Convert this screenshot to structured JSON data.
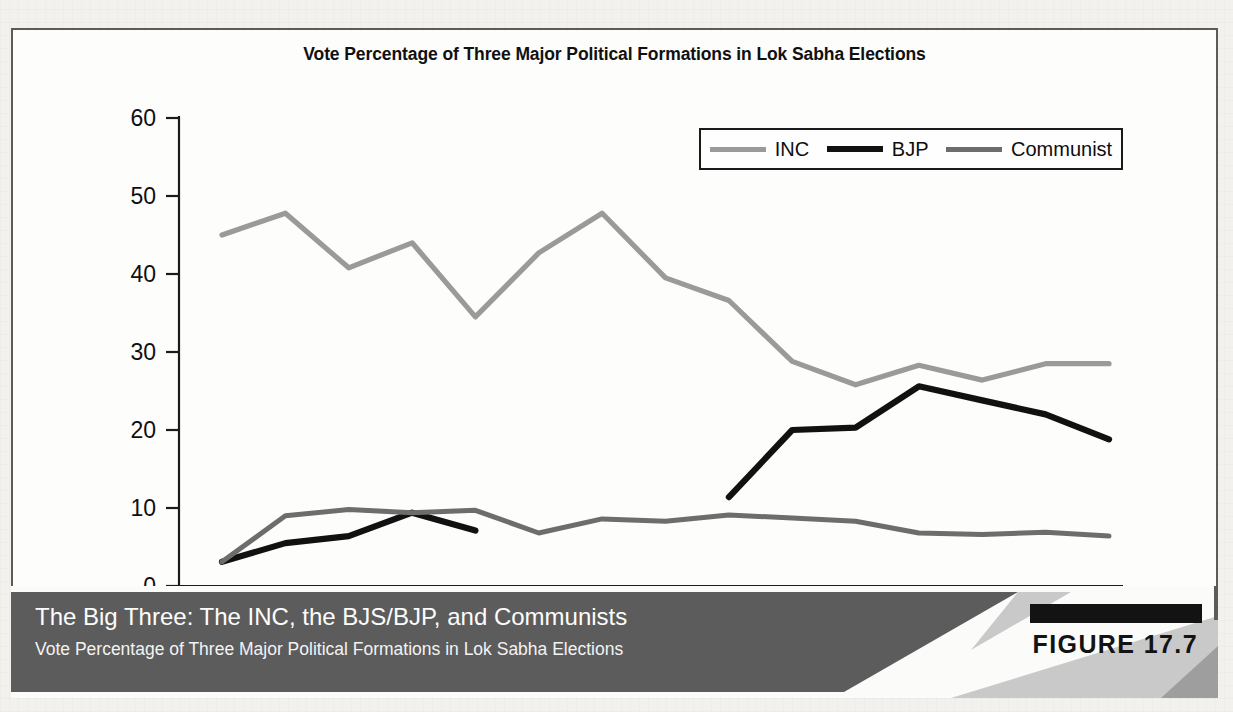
{
  "figure": {
    "badge_label": "FIGURE 17.7",
    "caption_title": "The Big Three: The INC, the BJS/BJP, and Communists",
    "caption_subtitle": "Vote Percentage of Three Major Political Formations in Lok Sabha Elections"
  },
  "colors": {
    "inc": "#9a9a9a",
    "bjp": "#111111",
    "communist": "#6d6d6d",
    "axis": "#1b1b1b",
    "panel_border": "#5b5b5b",
    "caption_bar": "#5c5c5c",
    "caption_bar_light": "#c9c9c9",
    "page": "#f2f1ee"
  },
  "chart_data": {
    "type": "line",
    "title": "Vote Percentage of Three Major Political Formations in Lok Sabha Elections",
    "xlabel": "",
    "ylabel": "",
    "ylim": [
      0,
      60
    ],
    "yticks": [
      0,
      10,
      20,
      30,
      40,
      50,
      60
    ],
    "grid": false,
    "legend_position": "top-right",
    "categories": [
      "1952",
      "1957",
      "1962",
      "1967",
      "1971",
      "1977",
      "1980",
      "1984",
      "1989",
      "1991",
      "1996",
      "1998",
      "1999",
      "2004",
      "2009"
    ],
    "series": [
      {
        "name": "INC",
        "color": "#9a9a9a",
        "values": [
          45.0,
          47.8,
          40.8,
          44.0,
          34.5,
          42.7,
          47.8,
          39.5,
          36.6,
          28.8,
          25.8,
          28.3,
          26.4,
          28.5,
          null
        ],
        "values_by_year": {
          "1952": 45.0,
          "1957": 47.8,
          "1962": 40.8,
          "1967": 44.0,
          "1971": 34.5,
          "1977": 42.7,
          "1980": 47.8,
          "1984": 39.5,
          "1989": 36.6,
          "1991": 28.8,
          "1996": 25.8,
          "1998": 28.3,
          "1999": 26.4,
          "2004": 28.5,
          "2009": 28.5
        }
      },
      {
        "name": "BJP",
        "color": "#111111",
        "values_by_year": {
          "1952": 3.1,
          "1957": 5.5,
          "1962": 6.4,
          "1967": 9.4,
          "1971": 7.1,
          "1977": null,
          "1980": null,
          "1984": null,
          "1989": 11.4,
          "1991": 20.0,
          "1996": 20.3,
          "1998": 25.6,
          "1999": 23.8,
          "2004": 22.0,
          "2009": 18.8
        }
      },
      {
        "name": "Communist",
        "color": "#6d6d6d",
        "values_by_year": {
          "1952": 3.1,
          "1957": 9.0,
          "1962": 9.8,
          "1967": 9.4,
          "1971": 9.7,
          "1977": 6.8,
          "1980": 8.6,
          "1984": 8.3,
          "1989": 9.1,
          "1996": 8.3,
          "1991": 8.7,
          "1998": 6.8,
          "1999": 6.6,
          "2004": 6.9,
          "2009": 6.4
        }
      }
    ]
  },
  "legend": {
    "entries": [
      {
        "label": "INC",
        "color": "#9a9a9a",
        "thickness": 5
      },
      {
        "label": "BJP",
        "color": "#111111",
        "thickness": 6
      },
      {
        "label": "Communist",
        "color": "#6d6d6d",
        "thickness": 5
      }
    ]
  },
  "axis": {
    "y_tick_labels": [
      "60",
      "50",
      "40",
      "30",
      "20",
      "10",
      "0"
    ],
    "x_tick_labels": [
      "1952",
      "1957",
      "1962",
      "1967",
      "1971",
      "1977",
      "1980",
      "1984",
      "1989",
      "1991",
      "1996",
      "1998",
      "1999",
      "2004",
      "2009"
    ]
  }
}
